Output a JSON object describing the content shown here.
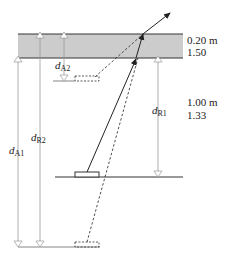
{
  "diagram": {
    "type": "refraction-apparent-depth",
    "layers": [
      {
        "name": "upper-layer",
        "thickness": "0.20 m",
        "index": "1.50",
        "fill": "#cccccc"
      },
      {
        "name": "lower-layer",
        "thickness": "1.00 m",
        "index": "1.33",
        "fill": "#ffffff"
      }
    ],
    "labels": {
      "layer1_thickness": "0.20 m",
      "layer1_index": "1.50",
      "layer2_thickness": "1.00 m",
      "layer2_index": "1.33",
      "dA2": {
        "main": "d",
        "sub": "A2"
      },
      "dR2": {
        "main": "d",
        "sub": "R2"
      },
      "dA1": {
        "main": "d",
        "sub": "A1"
      },
      "dR1": {
        "main": "d",
        "sub": "R1"
      }
    },
    "colors": {
      "band": "#cccccc",
      "line": "#333333",
      "dimension": "#999999",
      "ray": "#222222"
    }
  }
}
